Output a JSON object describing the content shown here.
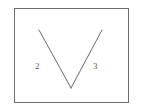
{
  "figure": {
    "type": "geometric-angle-diagram",
    "background_color": "#ffffff",
    "frame": {
      "name": "bounding-rectangle",
      "border_color": "#6e6e70",
      "border_width_px": 1,
      "fill_color": "#ffffff",
      "x": 14,
      "y": 8,
      "width": 115,
      "height": 95
    },
    "stroke_color": "#6a6a6c",
    "stroke_width_px": 1,
    "vertex": {
      "x": 71,
      "y": 88
    },
    "rays": [
      {
        "name": "left-ray",
        "label": "2",
        "from_x": 71,
        "from_y": 88,
        "to_x": 39,
        "to_y": 30
      },
      {
        "name": "right-ray",
        "label": "3",
        "from_x": 71,
        "from_y": 88,
        "to_x": 102,
        "to_y": 30
      }
    ],
    "labels": [
      {
        "id": "label-2",
        "text": "2",
        "x": 35,
        "y": 62,
        "color": "#5d5d5f",
        "font_size_px": 9
      },
      {
        "id": "label-3",
        "text": "3",
        "x": 93,
        "y": 62,
        "color": "#5d5d5f",
        "font_size_px": 9
      }
    ]
  }
}
